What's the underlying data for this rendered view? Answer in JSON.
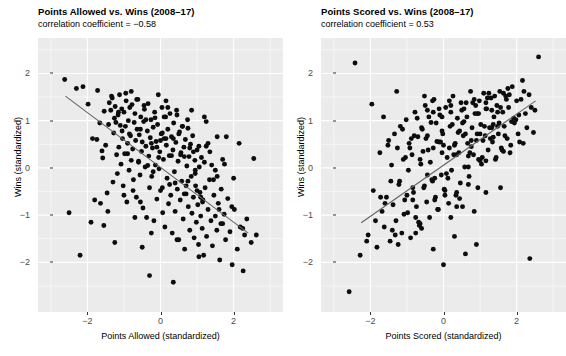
{
  "figure": {
    "width": 566,
    "height": 356,
    "background_color": "#ffffff",
    "panel_background_color": "#ebebeb",
    "gridline_color": "#ffffff",
    "point_color": "#0d0d0d",
    "fitline_color": "#666666"
  },
  "chart_data": [
    {
      "type": "scatter",
      "title": "Points Allowed vs. Wins (2008–17)",
      "subtitle": "correlation coefficient = −0.58",
      "correlation": -0.58,
      "xlabel": "Points Allowed (standardized)",
      "ylabel": "Wins (standardized)",
      "xlim": [
        -3.35,
        3.35
      ],
      "ylim": [
        -3.05,
        2.75
      ],
      "xticks": [
        -2,
        0,
        2
      ],
      "xtick_labels": [
        "−2",
        "0",
        "2"
      ],
      "yticks": [
        -2,
        -1,
        0,
        1,
        2
      ],
      "ytick_labels": [
        "−2",
        "−1",
        "0",
        "1",
        "2"
      ],
      "grid": true,
      "legend": "none",
      "fit_line": {
        "x": [
          -2.6,
          2.4
        ],
        "y": [
          1.52,
          -1.38
        ]
      },
      "x": [
        -2.62,
        -2.3,
        -2.12,
        -1.98,
        -1.86,
        -1.74,
        -1.72,
        -1.66,
        -1.6,
        -1.58,
        -1.54,
        -1.5,
        -1.46,
        -1.42,
        -1.4,
        -1.36,
        -1.32,
        -1.3,
        -1.28,
        -1.26,
        -1.24,
        -1.22,
        -1.2,
        -1.18,
        -1.16,
        -1.14,
        -1.12,
        -1.1,
        -1.08,
        -1.06,
        -1.04,
        -1.02,
        -1.0,
        -0.98,
        -0.96,
        -0.94,
        -0.92,
        -0.9,
        -0.88,
        -0.86,
        -0.84,
        -0.82,
        -0.8,
        -0.78,
        -0.76,
        -0.74,
        -0.72,
        -0.7,
        -0.68,
        -0.66,
        -0.64,
        -0.62,
        -0.6,
        -0.58,
        -0.56,
        -0.54,
        -0.52,
        -0.5,
        -0.48,
        -0.46,
        -0.44,
        -0.42,
        -0.4,
        -0.38,
        -0.36,
        -0.34,
        -0.32,
        -0.3,
        -0.28,
        -0.26,
        -0.24,
        -0.22,
        -0.2,
        -0.18,
        -0.16,
        -0.14,
        -0.12,
        -0.1,
        -0.08,
        -0.06,
        -0.04,
        -0.02,
        0.0,
        0.02,
        0.04,
        0.06,
        0.08,
        0.1,
        0.12,
        0.14,
        0.16,
        0.18,
        0.2,
        0.22,
        0.24,
        0.26,
        0.28,
        0.3,
        0.32,
        0.34,
        0.36,
        0.38,
        0.4,
        0.42,
        0.44,
        0.46,
        0.48,
        0.5,
        0.52,
        0.54,
        0.56,
        0.58,
        0.6,
        0.62,
        0.64,
        0.66,
        0.68,
        0.7,
        0.72,
        0.74,
        0.76,
        0.78,
        0.8,
        0.82,
        0.84,
        0.86,
        0.88,
        0.9,
        0.92,
        0.94,
        0.96,
        0.98,
        1.0,
        1.02,
        1.04,
        1.06,
        1.08,
        1.1,
        1.12,
        1.14,
        1.16,
        1.18,
        1.2,
        1.22,
        1.26,
        1.3,
        1.34,
        1.38,
        1.42,
        1.46,
        1.5,
        1.54,
        1.58,
        1.62,
        1.66,
        1.7,
        1.74,
        1.78,
        1.84,
        1.9,
        1.96,
        2.02,
        2.1,
        2.18,
        2.26,
        2.36,
        2.48,
        2.62,
        -2.5,
        -2.2,
        -1.9,
        -1.64,
        -1.44,
        -1.34,
        -1.15,
        -1.05,
        -0.95,
        -0.85,
        -0.75,
        -0.65,
        -0.55,
        -0.45,
        -0.35,
        -0.25,
        -0.15,
        -0.05,
        0.05,
        0.15,
        0.25,
        0.35,
        0.45,
        0.55,
        0.65,
        0.75,
        0.85,
        0.95,
        1.05,
        1.15,
        1.25,
        1.35,
        1.45,
        1.55,
        1.65,
        1.75,
        1.95,
        2.15,
        2.3,
        2.55,
        -1.8,
        -1.55,
        -1.25,
        -1.0,
        -0.8,
        -0.6,
        -0.4,
        -0.2,
        0.0,
        0.2,
        0.4,
        0.6,
        0.8,
        1.0,
        1.2,
        1.4,
        1.6,
        1.8,
        2.0,
        2.25,
        -0.9,
        -0.7,
        -0.5,
        -0.3,
        -0.1,
        0.1,
        0.3,
        0.5,
        0.7,
        0.9,
        1.1,
        1.3,
        1.5,
        1.7,
        -0.55,
        -0.25,
        0.05,
        0.35,
        0.65,
        0.95,
        1.25,
        1.55,
        0.15,
        0.45,
        0.75,
        1.05
      ],
      "y": [
        1.87,
        1.68,
        1.72,
        1.35,
        0.62,
        0.6,
        1.64,
        0.95,
        0.36,
        0.21,
        1.2,
        0.48,
        -0.53,
        0.92,
        1.38,
        1.22,
        1.48,
        -0.3,
        0.74,
        1.05,
        1.3,
        0.96,
        0.28,
        -0.12,
        1.12,
        0.44,
        1.55,
        0.9,
        0.08,
        1.25,
        0.62,
        -0.38,
        1.18,
        0.3,
        0.88,
        1.42,
        -0.72,
        0.52,
        1.0,
        -0.05,
        1.28,
        0.68,
        0.16,
        1.34,
        0.4,
        -0.25,
        0.96,
        1.15,
        0.58,
        -0.62,
        0.82,
        1.45,
        0.12,
        0.7,
        -0.15,
        1.08,
        0.35,
        0.55,
        -0.85,
        0.98,
        1.24,
        0.02,
        0.46,
        -1.05,
        0.78,
        1.36,
        0.25,
        -0.42,
        0.64,
        1.02,
        -0.18,
        0.42,
        0.86,
        -1.12,
        1.18,
        0.06,
        0.56,
        -0.66,
        0.92,
        1.55,
        -0.02,
        0.34,
        -0.48,
        0.72,
        1.28,
        -0.95,
        0.18,
        0.62,
        -1.25,
        1.08,
        0.48,
        -0.22,
        0.82,
        -0.76,
        0.26,
        1.15,
        -0.58,
        0.66,
        -1.38,
        0.38,
        0.95,
        -0.08,
        -0.92,
        0.54,
        1.22,
        -0.45,
        0.14,
        -1.52,
        0.76,
        -0.68,
        0.32,
        -0.28,
        0.88,
        -1.08,
        0.44,
        -1.72,
        0.6,
        -0.55,
        0.04,
        1.02,
        -0.82,
        0.24,
        -1.32,
        0.5,
        -0.18,
        -0.96,
        0.68,
        -0.62,
        -1.48,
        0.16,
        -0.38,
        -1.15,
        0.38,
        -0.78,
        -1.62,
        0.02,
        -0.52,
        -1.02,
        0.22,
        -1.28,
        -0.68,
        -1.85,
        0.12,
        -0.42,
        -1.45,
        -0.88,
        -0.25,
        -1.12,
        -1.65,
        -0.58,
        -0.05,
        -1.32,
        -0.75,
        -1.95,
        -0.45,
        -1.18,
        -0.98,
        -1.52,
        -0.65,
        -1.35,
        -2.05,
        -0.88,
        -1.72,
        -1.25,
        -2.18,
        -1.08,
        -1.58,
        -1.42,
        -0.95,
        -1.85,
        -1.15,
        -0.75,
        -0.92,
        1.52,
        1.18,
        0.78,
        1.58,
        0.72,
        -0.48,
        1.45,
        0.82,
        1.32,
        0.05,
        0.52,
        1.06,
        0.22,
        0.74,
        1.42,
        -0.35,
        0.62,
        1.12,
        0.28,
        -0.55,
        0.84,
        1.22,
        -0.12,
        0.46,
        -0.72,
        0.98,
        0.34,
        -0.25,
        0.66,
        -1.18,
        0.08,
        -0.82,
        0.52,
        -1.42,
        0.2,
        -0.68,
        -1.22,
        -1.58,
        -0.58,
        1.62,
        0.14,
        1.02,
        -0.08,
        0.58,
        1.28,
        -0.32,
        0.88,
        0.42,
        -0.48,
        1.08,
        0.06,
        -0.88,
        0.66,
        -0.22,
        -1.28,
        0.3,
        -1.05,
        -1.68,
        -2.28,
        0.44,
        1.08,
        0.26,
        0.72,
        -0.38,
        0.34,
        -0.62,
        0.52,
        -1.02,
        0.18,
        -0.72,
        -1.38,
        -0.42,
        -2.42,
        0.24,
        -0.05,
        0.46,
        -0.18,
        0.62,
        -1.52,
        -0.28,
        -1.88,
        2.38,
        -0.35,
        2.36,
        -2.68
      ]
    },
    {
      "type": "scatter",
      "title": "Points Scored vs. Wins (2008–17)",
      "subtitle": "correlation coefficient = 0.53",
      "correlation": 0.53,
      "xlabel": "Points Scored (standardized)",
      "ylabel": "Wins (standardized)",
      "xlim": [
        -3.35,
        3.35
      ],
      "ylim": [
        -3.05,
        2.75
      ],
      "xticks": [
        -2,
        0,
        2
      ],
      "xtick_labels": [
        "−2",
        "0",
        "2"
      ],
      "yticks": [
        -2,
        -1,
        0,
        1,
        2
      ],
      "ytick_labels": [
        "−2",
        "−1",
        "0",
        "1",
        "2"
      ],
      "grid": true,
      "legend": "none",
      "fit_line": {
        "x": [
          -2.25,
          2.52
        ],
        "y": [
          -1.16,
          1.42
        ]
      },
      "x": [
        -2.58,
        -2.28,
        -2.06,
        -1.92,
        -1.82,
        -1.74,
        -1.68,
        -1.62,
        -1.56,
        -1.5,
        -1.46,
        -1.42,
        -1.38,
        -1.34,
        -1.3,
        -1.26,
        -1.22,
        -1.18,
        -1.14,
        -1.1,
        -1.06,
        -1.02,
        -0.98,
        -0.94,
        -0.9,
        -0.86,
        -0.82,
        -0.78,
        -0.74,
        -0.7,
        -0.66,
        -0.62,
        -0.58,
        -0.54,
        -0.5,
        -0.46,
        -0.42,
        -0.38,
        -0.34,
        -0.3,
        -0.26,
        -0.22,
        -0.18,
        -0.14,
        -0.1,
        -0.06,
        -0.02,
        0.02,
        0.06,
        0.1,
        0.14,
        0.18,
        0.22,
        0.26,
        0.3,
        0.34,
        0.38,
        0.42,
        0.46,
        0.5,
        0.54,
        0.58,
        0.62,
        0.66,
        0.7,
        0.74,
        0.78,
        0.82,
        0.86,
        0.9,
        0.94,
        0.98,
        1.02,
        1.06,
        1.1,
        1.14,
        1.18,
        1.22,
        1.26,
        1.3,
        1.34,
        1.38,
        1.42,
        1.46,
        1.5,
        1.54,
        1.58,
        1.62,
        1.66,
        1.7,
        1.74,
        1.78,
        1.82,
        1.88,
        1.94,
        2.0,
        2.08,
        2.16,
        2.24,
        2.34,
        2.46,
        2.6,
        -2.42,
        -2.1,
        -1.86,
        -1.6,
        -1.4,
        -1.2,
        -1.0,
        -0.88,
        -0.76,
        -0.64,
        -0.52,
        -0.4,
        -0.28,
        -0.16,
        -0.04,
        0.08,
        0.2,
        0.32,
        0.44,
        0.56,
        0.68,
        0.8,
        0.92,
        1.04,
        1.16,
        1.28,
        1.4,
        1.52,
        1.64,
        1.76,
        1.92,
        2.12,
        2.28,
        2.5,
        -1.96,
        -1.72,
        -1.52,
        -1.32,
        -1.12,
        -0.96,
        -0.8,
        -0.68,
        -0.56,
        -0.44,
        -0.32,
        -0.2,
        -0.08,
        0.04,
        0.16,
        0.28,
        0.4,
        0.52,
        0.64,
        0.76,
        0.88,
        1.0,
        1.12,
        1.24,
        1.36,
        1.48,
        1.6,
        1.72,
        1.86,
        2.04,
        2.2,
        2.4,
        -1.64,
        -1.44,
        -1.24,
        -1.04,
        -0.84,
        -0.72,
        -0.6,
        -0.48,
        -0.36,
        -0.24,
        -0.12,
        0.0,
        0.12,
        0.24,
        0.36,
        0.48,
        0.6,
        0.72,
        0.84,
        0.96,
        1.08,
        1.2,
        1.32,
        1.44,
        1.56,
        1.68,
        1.8,
        1.98,
        2.18,
        -1.28,
        -1.08,
        -0.92,
        -0.76,
        -0.6,
        -0.44,
        -0.28,
        -0.12,
        0.04,
        0.2,
        0.36,
        0.52,
        0.68,
        0.84,
        1.0,
        1.16,
        1.32,
        1.48,
        1.64,
        1.84,
        2.06,
        -0.84,
        -0.64,
        -0.44,
        -0.24,
        -0.04,
        0.16,
        0.36,
        0.56,
        0.76,
        0.96,
        1.16,
        1.36,
        1.56,
        -0.52,
        -0.28,
        -0.04,
        0.2,
        0.44,
        0.68,
        0.92,
        1.16,
        -0.3,
        0.0,
        0.3,
        0.6,
        0.9,
        2.36
      ],
      "y": [
        -2.62,
        -1.85,
        -1.42,
        -0.48,
        -1.68,
        0.32,
        -0.92,
        -1.25,
        -0.62,
        0.58,
        -1.55,
        0.06,
        -0.78,
        0.72,
        -1.12,
        0.42,
        -0.35,
        0.88,
        -1.38,
        0.18,
        -0.68,
        1.02,
        -0.95,
        0.52,
        -1.48,
        0.28,
        -0.52,
        1.18,
        -0.82,
        0.66,
        -1.22,
        0.08,
        0.82,
        -0.42,
        1.32,
        -0.72,
        0.38,
        -1.05,
        0.96,
        -0.28,
        1.45,
        -0.62,
        0.56,
        -0.88,
        1.12,
        -0.15,
        0.72,
        -0.45,
        1.28,
        0.22,
        -0.75,
        0.88,
        -0.05,
        1.52,
        0.48,
        -0.58,
        1.05,
        0.32,
        -0.32,
        1.22,
        0.68,
        0.02,
        1.38,
        0.52,
        -0.18,
        1.62,
        0.85,
        0.28,
        1.15,
        0.58,
        -0.42,
        1.42,
        0.92,
        0.22,
        1.58,
        0.68,
        1.25,
        0.38,
        0.85,
        1.48,
        0.55,
        1.08,
        0.18,
        1.32,
        0.72,
        1.62,
        0.42,
        1.18,
        0.88,
        1.52,
        0.62,
        1.28,
        0.32,
        1.72,
        0.95,
        1.42,
        0.55,
        1.85,
        1.15,
        1.55,
        0.75,
        2.35,
        2.22,
        -1.55,
        -1.12,
        -0.75,
        -1.32,
        -0.28,
        -0.58,
        0.62,
        -1.05,
        0.18,
        -0.38,
        1.08,
        0.42,
        -0.88,
        0.78,
        -0.12,
        1.18,
        0.52,
        -0.65,
        0.98,
        0.25,
        1.38,
        0.72,
        0.08,
        1.25,
        0.62,
        1.52,
        0.95,
        0.35,
        1.68,
        1.05,
        1.45,
        0.85,
        1.22,
        1.35,
        -0.62,
        0.48,
        -1.42,
        0.82,
        -0.05,
        0.68,
        -1.15,
        0.35,
        1.22,
        -0.25,
        0.95,
        0.55,
        -0.48,
        1.42,
        0.28,
        0.75,
        -0.82,
        1.08,
        0.45,
        1.32,
        0.15,
        0.88,
        1.58,
        0.65,
        1.18,
        0.38,
        1.45,
        0.98,
        0.72,
        1.62,
        1.28,
        1.08,
        -0.28,
        -1.62,
        0.22,
        -0.42,
        1.05,
        -1.28,
        0.62,
        0.12,
        -0.68,
        1.25,
        0.48,
        -0.22,
        0.92,
        -0.52,
        1.38,
        0.72,
        0.32,
        -0.92,
        1.15,
        0.58,
        1.48,
        0.85,
        0.22,
        1.28,
        0.68,
        1.55,
        1.02,
        0.52,
        1.62,
        -0.98,
        0.42,
        -1.38,
        0.85,
        -0.15,
        1.18,
        0.55,
        -0.58,
        1.32,
        0.28,
        0.95,
        -0.35,
        1.45,
        0.72,
        0.15,
        1.22,
        0.88,
        1.58,
        0.48,
        1.12,
        -0.68,
        -1.18,
        0.68,
        -0.22,
        1.08,
        0.42,
        -0.82,
        1.25,
        0.58,
        0.18,
        1.38,
        0.92,
        -0.42,
        1.52,
        -1.72,
        0.32,
        -1.05,
        0.78,
        0.02,
        1.15,
        -0.52,
        1.42,
        -2.05,
        -1.45,
        -1.82,
        -1.62,
        -1.92,
        2.32
      ]
    }
  ]
}
